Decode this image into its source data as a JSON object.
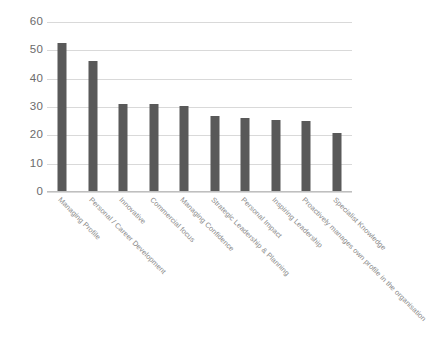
{
  "chart_data": {
    "type": "bar",
    "title": "",
    "subtitle": "",
    "xlabel": "",
    "ylabel": "",
    "ylim": [
      0,
      60
    ],
    "yticks": [
      0,
      10,
      20,
      30,
      40,
      50,
      60
    ],
    "grid": true,
    "legend": false,
    "legend_position": "none",
    "series_color": "#595959",
    "gridline_color": "#d9d9d9",
    "tick_label_color": "#6b6b6b",
    "category_label_color": "#8a8a8a",
    "category_label_rotation": 45,
    "categories": [
      "Managing Profile",
      "Personal / Career Development",
      "Innovative",
      "Commercial focus",
      "Managing Confidence",
      "Strategic Leadership & Planning",
      "Personal Impact",
      "Inspiring Leadership",
      "Proactively manages own profile in the organisation",
      "Specialist Knowledge"
    ],
    "values": [
      52.5,
      46.1,
      31.0,
      31.0,
      30.2,
      27.0,
      26.2,
      25.5,
      25.0,
      20.7
    ]
  }
}
